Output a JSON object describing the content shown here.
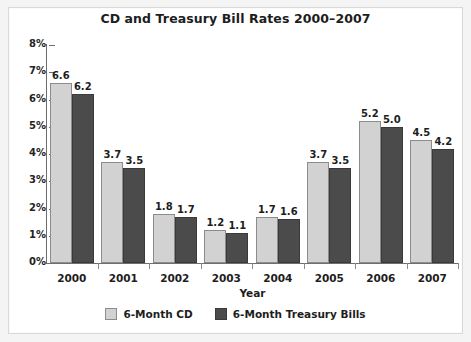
{
  "chart_data": {
    "type": "bar",
    "title": "CD and Treasury Bill Rates 2000–2007",
    "xlabel": "Year",
    "ylabel": "",
    "ylim": [
      0,
      8
    ],
    "ytick_labels": [
      "0%",
      "1%",
      "2%",
      "3%",
      "4%",
      "5%",
      "6%",
      "7%",
      "8%"
    ],
    "ytick_values": [
      0,
      1,
      2,
      3,
      4,
      5,
      6,
      7,
      8
    ],
    "grid": false,
    "legend_position": "bottom-center",
    "categories": [
      "2000",
      "2001",
      "2002",
      "2003",
      "2004",
      "2005",
      "2006",
      "2007"
    ],
    "series": [
      {
        "name": "6-Month CD",
        "color": "#d2d2d2",
        "values": [
          6.6,
          3.7,
          1.8,
          1.2,
          1.7,
          3.7,
          5.2,
          4.5
        ],
        "labels": [
          "6.6",
          "3.7",
          "1.8",
          "1.2",
          "1.7",
          "3.7",
          "5.2",
          "4.5"
        ]
      },
      {
        "name": "6-Month Treasury Bills",
        "color": "#4b4b4b",
        "values": [
          6.2,
          3.5,
          1.7,
          1.1,
          1.6,
          3.5,
          5.0,
          4.2
        ],
        "labels": [
          "6.2",
          "3.5",
          "1.7",
          "1.1",
          "1.6",
          "3.5",
          "5.0",
          "4.2"
        ]
      }
    ]
  },
  "legend": {
    "items": [
      {
        "label": "6-Month CD"
      },
      {
        "label": "6-Month Treasury Bills"
      }
    ]
  }
}
